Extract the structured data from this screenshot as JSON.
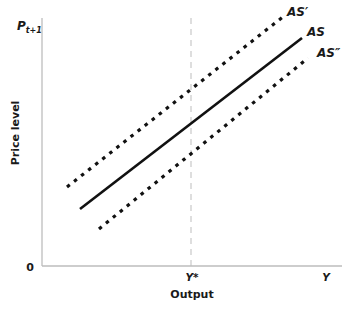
{
  "diagram": {
    "y_axis": {
      "title": "Price level",
      "top_label": "P",
      "top_label_sub": "t+1"
    },
    "x_axis": {
      "title": "Output",
      "origin_label": "0",
      "tick_label": "Y*",
      "end_label": "Y"
    },
    "curves": [
      {
        "id": "AS_prime",
        "label": "AS′",
        "style": "dotted"
      },
      {
        "id": "AS",
        "label": "AS",
        "style": "solid"
      },
      {
        "id": "AS_double_prime",
        "label": "AS″",
        "style": "dotted"
      }
    ],
    "reference_line": {
      "label": "Y*",
      "style": "dashed",
      "orientation": "vertical"
    },
    "colors": {
      "axis": "#bdbdbd",
      "curve": "#111111",
      "reference": "#bdbdbd",
      "text": "#1a1a1a"
    }
  }
}
